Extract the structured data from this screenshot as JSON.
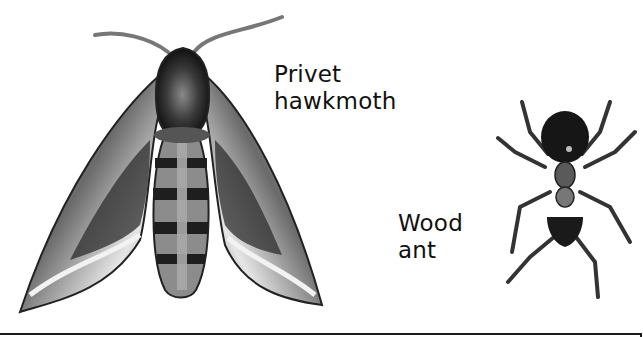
{
  "illustration": {
    "insects": [
      {
        "id": "moth",
        "label_lines": [
          "Privet",
          "hawkmoth"
        ]
      },
      {
        "id": "ant",
        "label_lines": [
          "Wood",
          "ant"
        ]
      }
    ]
  },
  "colors": {
    "background": "#ffffff",
    "ink": "#111111",
    "dark_body": "#1c1c1c",
    "wing_mid": "#6e6e6e",
    "wing_light": "#d8d8d8"
  }
}
